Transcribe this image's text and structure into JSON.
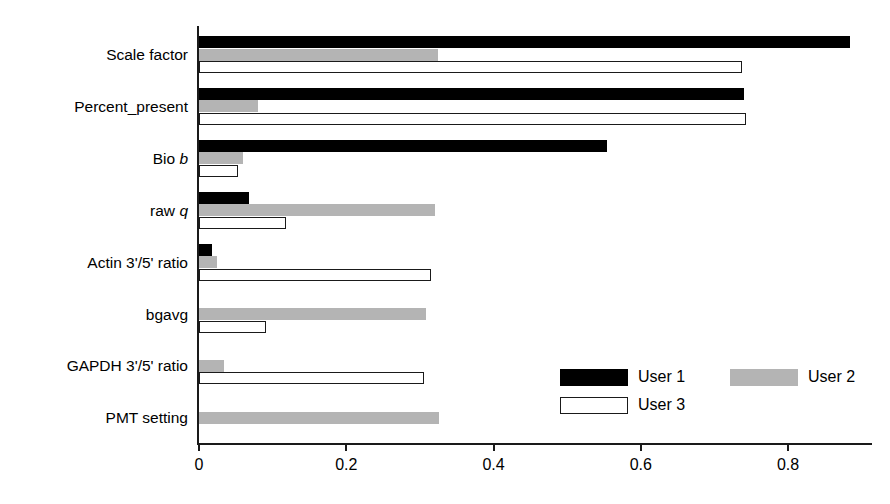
{
  "chart_data": {
    "type": "bar",
    "orientation": "horizontal",
    "title": "",
    "xlabel": "",
    "ylabel": "",
    "xlim": [
      0,
      0.92
    ],
    "xticks": [
      "0",
      "0.2",
      "0.4",
      "0.6",
      "0.8"
    ],
    "xtick_values": [
      0,
      0.2,
      0.4,
      0.6,
      0.8
    ],
    "grid": false,
    "legend_position": "bottom-right",
    "categories": [
      "Scale factor",
      "Percent_present",
      "Bio b",
      "raw q",
      "Actin 3'/5' ratio",
      "bgavg",
      "GAPDH 3'/5' ratio",
      "PMT setting"
    ],
    "category_labels_html": [
      "Scale factor",
      "Percent_present",
      "Bio <i>b</i>",
      "raw <i>q</i>",
      "Actin 3'/5' ratio",
      "bgavg",
      "GAPDH 3'/5' ratio",
      "PMT setting"
    ],
    "series": [
      {
        "name": "User 1",
        "color": "#000000",
        "values": [
          0.884,
          0.74,
          0.554,
          0.068,
          0.018,
          0.0,
          0.0,
          0.0
        ]
      },
      {
        "name": "User 2",
        "color": "#b4b4b4",
        "values": [
          0.325,
          0.08,
          0.06,
          0.321,
          0.024,
          0.308,
          0.034,
          0.326
        ]
      },
      {
        "name": "User 3",
        "color": "#ffffff",
        "values": [
          0.738,
          0.743,
          0.053,
          0.118,
          0.315,
          0.091,
          0.306,
          0.0
        ]
      }
    ]
  },
  "legend": {
    "items": [
      {
        "label": "User 1",
        "swatch": "solid-black-swatch"
      },
      {
        "label": "User 2",
        "swatch": "gray-swatch"
      },
      {
        "label": "User 3",
        "swatch": "white-outline-swatch"
      }
    ]
  }
}
